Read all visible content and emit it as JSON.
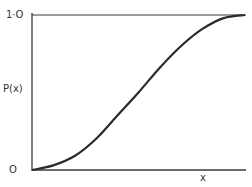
{
  "chart_data": {
    "type": "line",
    "title": "",
    "xlabel": "x",
    "ylabel": "P(x)",
    "ytick_labels": [
      "O",
      "1·O"
    ],
    "origin_label": "O",
    "top_label": "1·O",
    "ylim": [
      0,
      1.0
    ],
    "grid": false,
    "legend": null,
    "annotations": [
      "horizontal asymptote line at P(x)=1.0"
    ],
    "series": [
      {
        "name": "P(x)",
        "description": "sigmoid cumulative distribution curve rising from 0 to 1",
        "x": [
          0.0,
          0.1,
          0.2,
          0.3,
          0.4,
          0.5,
          0.6,
          0.7,
          0.8,
          0.9,
          1.0
        ],
        "values": [
          0.0,
          0.03,
          0.09,
          0.2,
          0.35,
          0.5,
          0.66,
          0.8,
          0.91,
          0.98,
          1.0
        ]
      }
    ],
    "colors": {
      "line": "#2a2a2a",
      "axis": "#3a3a3a"
    }
  }
}
